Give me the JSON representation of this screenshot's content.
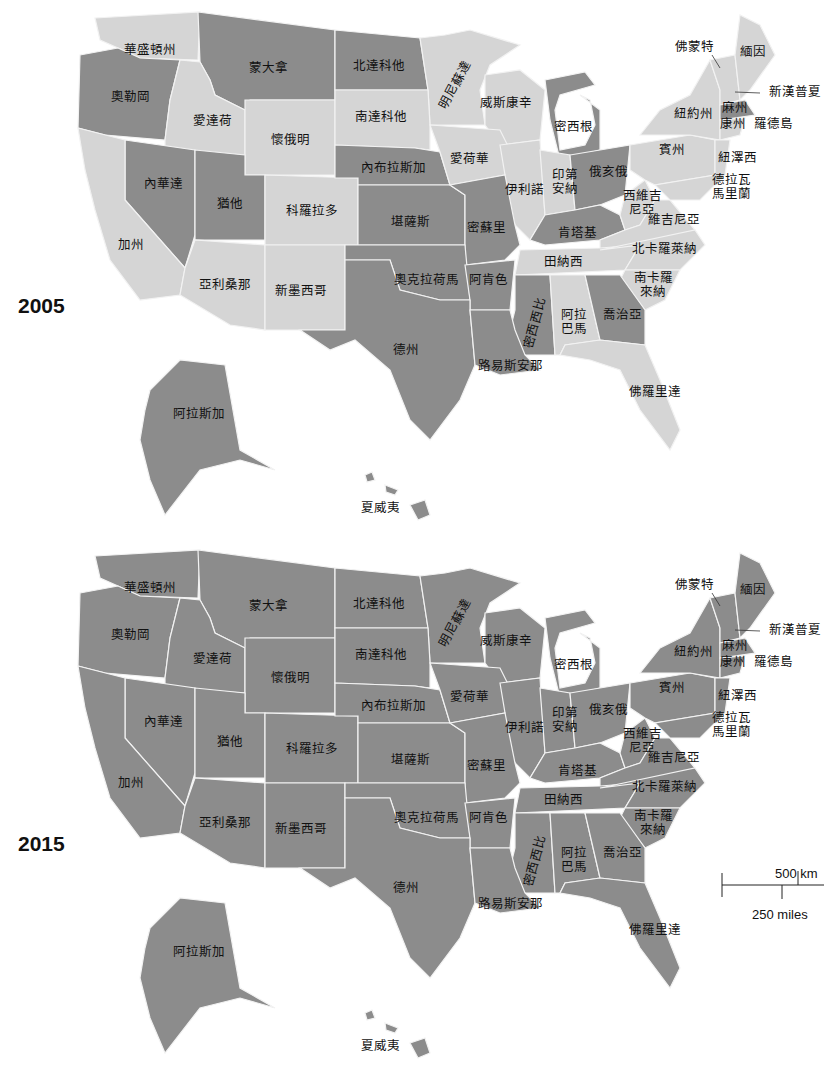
{
  "colors": {
    "changed_fill": "#8c8c8c",
    "unchanged_fill": "#d5d5d5",
    "border": "#f2f2f2",
    "background": "#ffffff"
  },
  "legend": {
    "dark": "state shaded (policy in place)",
    "light": "state not shaded"
  },
  "maps": [
    {
      "year": "2005",
      "dark_states": [
        "奧勒岡",
        "蒙大拿",
        "北達科他",
        "內華達",
        "猶他",
        "內布拉斯加",
        "堪薩斯",
        "奧克拉荷馬",
        "德州",
        "密蘇里",
        "阿肯色",
        "路易斯安那",
        "密西西比",
        "喬治亞",
        "密西根",
        "俄亥俄",
        "肯塔基",
        "麻州",
        "阿拉斯加",
        "夏威夷"
      ],
      "light_states": [
        "華盛頓州",
        "愛達荷",
        "懷俄明",
        "南達科他",
        "明尼蘇達",
        "威斯康辛",
        "愛荷華",
        "伊利諾",
        "印第安納",
        "科羅拉多",
        "加州",
        "亞利桑那",
        "新墨西哥",
        "田納西",
        "阿拉巴馬",
        "佛羅里達",
        "南卡羅來納",
        "北卡羅萊納",
        "維吉尼亞",
        "西維吉尼亞",
        "賓州",
        "紐約州",
        "佛蒙特",
        "緬因",
        "新漢普夏",
        "康州",
        "羅德島",
        "紐澤西",
        "德拉瓦",
        "馬里蘭"
      ]
    },
    {
      "year": "2015",
      "dark_states": "all",
      "light_states": []
    }
  ],
  "labels": {
    "wa": "華盛頓州",
    "or": "奧勒岡",
    "mt": "蒙大拿",
    "nd": "北達科他",
    "mn": "明尼蘇達",
    "id": "愛達荷",
    "wy": "懷俄明",
    "sd": "南達科他",
    "wi": "威斯康辛",
    "mi": "密西根",
    "nv": "內華達",
    "ut": "猶他",
    "co": "科羅拉多",
    "ne": "內布拉斯加",
    "ia": "愛荷華",
    "il": "伊利諾",
    "in": "印第\n安納",
    "oh": "俄亥俄",
    "ca": "加州",
    "ks": "堪薩斯",
    "mo": "密蘇里",
    "ky": "肯塔基",
    "wv": "西維吉\n尼亞",
    "va": "維吉尼亞",
    "az": "亞利桑那",
    "nm": "新墨西哥",
    "ok": "奧克拉荷馬",
    "ar": "阿肯色",
    "tn": "田納西",
    "nc": "北卡羅萊納",
    "sc": "南卡羅\n來納",
    "ms": "密西西比",
    "al": "阿拉\n巴馬",
    "ga": "喬治亞",
    "tx": "德州",
    "la": "路易斯安那",
    "fl": "佛羅里達",
    "ak": "阿拉斯加",
    "hi": "夏威夷",
    "vt": "佛蒙特",
    "me": "緬因",
    "nh": "新漢普夏",
    "ny": "紐約州",
    "ma": "麻州",
    "ct": "康州",
    "ri": "羅德島",
    "pa": "賓州",
    "nj": "紐澤西",
    "de_md": "德拉瓦\n馬里蘭"
  },
  "scale_bar": {
    "km_label": "500 km",
    "miles_label": "250 miles"
  }
}
